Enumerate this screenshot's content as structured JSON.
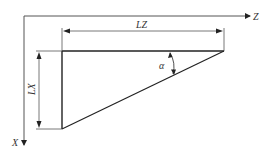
{
  "diagram": {
    "axes": {
      "horizontal_label": "Z",
      "vertical_label": "X"
    },
    "dimensions": {
      "horizontal_label": "LZ",
      "vertical_label": "LX",
      "angle_label": "α"
    },
    "colors": {
      "line": "#222222",
      "thin_line": "#555555",
      "text": "#333333"
    }
  }
}
